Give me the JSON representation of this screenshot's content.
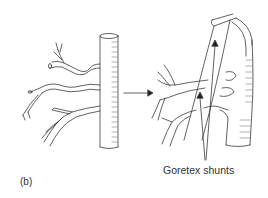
{
  "figure": {
    "panel_label": "(b)",
    "annotation": "Goretex shunts",
    "left_drawing": "original-vessel-with-branches",
    "right_drawing": "reconstructed-vessel-with-goretex-shunts",
    "transition_arrow": "arrow-right",
    "stroke_color": "#3a3a3a",
    "background_color": "#ffffff"
  }
}
